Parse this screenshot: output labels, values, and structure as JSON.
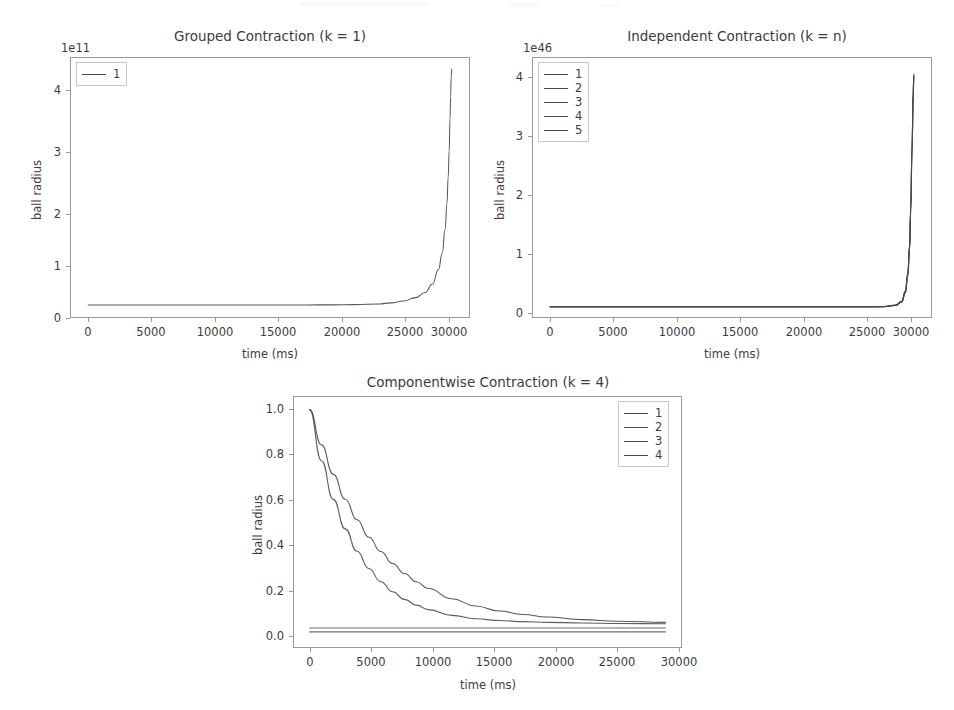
{
  "figure": {
    "background_color": "#ffffff",
    "line_color": "#4a4a4a",
    "axis_color": "#9a9a9a",
    "text_color": "#3c3c3c",
    "n_subplots": 3
  },
  "chart_data": [
    {
      "type": "line",
      "title": "Grouped Contraction (k = 1)",
      "xlabel": "time (ms)",
      "ylabel": "ball radius",
      "y_offset_text": "1e11",
      "xlim": [
        -1500,
        31500
      ],
      "ylim": [
        -0.25,
        4.75
      ],
      "xticks": [
        0,
        5000,
        10000,
        15000,
        20000,
        25000,
        30000
      ],
      "xticklabels": [
        "0",
        "5000",
        "10000",
        "15000",
        "20000",
        "25000",
        "30000"
      ],
      "yticks": [
        0,
        1,
        2,
        3,
        4
      ],
      "yticklabels": [
        "0",
        "1",
        "2",
        "3",
        "4"
      ],
      "grid": false,
      "legend_position": "upper left",
      "legend": [
        "1"
      ],
      "series": [
        {
          "name": "1",
          "x": [
            0,
            2000,
            4000,
            6000,
            8000,
            10000,
            12000,
            14000,
            16000,
            18000,
            20000,
            22000,
            24000,
            25000,
            26000,
            27000,
            27800,
            28400,
            28900,
            29200,
            29450,
            29600,
            29700,
            29780,
            29850,
            29900,
            29950,
            30000
          ],
          "y": [
            0.0,
            0.0,
            0.0,
            0.0,
            0.0,
            0.0,
            0.0,
            0.0,
            0.0,
            0.0,
            0.002,
            0.006,
            0.02,
            0.04,
            0.075,
            0.14,
            0.24,
            0.4,
            0.68,
            0.98,
            1.45,
            1.95,
            2.45,
            2.95,
            3.55,
            4.0,
            4.38,
            4.52
          ]
        }
      ]
    },
    {
      "type": "line",
      "title": "Independent Contraction (k = n)",
      "xlabel": "time (ms)",
      "ylabel": "ball radius",
      "y_offset_text": "1e46",
      "xlim": [
        -1500,
        31500
      ],
      "ylim": [
        -0.2,
        4.45
      ],
      "xticks": [
        0,
        5000,
        10000,
        15000,
        20000,
        25000,
        30000
      ],
      "xticklabels": [
        "0",
        "5000",
        "10000",
        "15000",
        "20000",
        "25000",
        "30000"
      ],
      "yticks": [
        0,
        1,
        2,
        3,
        4
      ],
      "yticklabels": [
        "0",
        "1",
        "2",
        "3",
        "4"
      ],
      "grid": false,
      "legend_position": "upper left",
      "legend": [
        "1",
        "2",
        "3",
        "4",
        "5"
      ],
      "series": [
        {
          "name": "1",
          "x": [
            0,
            5000,
            10000,
            15000,
            20000,
            24000,
            26000,
            27500,
            28500,
            29000,
            29300,
            29500,
            29650,
            29750,
            29850,
            29950,
            30000
          ],
          "y": [
            0.0,
            0.0,
            0.0,
            0.0,
            0.0,
            0.0,
            0.0,
            0.005,
            0.03,
            0.1,
            0.28,
            0.6,
            1.1,
            1.8,
            2.85,
            3.85,
            4.15
          ]
        },
        {
          "name": "2",
          "x": [
            0,
            5000,
            10000,
            15000,
            20000,
            24000,
            26000,
            27500,
            28500,
            29000,
            29300,
            29500,
            29650,
            29750,
            29850,
            29950,
            30000
          ],
          "y": [
            0.0,
            0.0,
            0.0,
            0.0,
            0.0,
            0.0,
            0.0,
            0.004,
            0.028,
            0.095,
            0.27,
            0.58,
            1.08,
            1.78,
            2.82,
            3.82,
            4.13
          ]
        },
        {
          "name": "3",
          "x": [
            0,
            5000,
            10000,
            15000,
            20000,
            24000,
            26000,
            27500,
            28500,
            29000,
            29300,
            29500,
            29650,
            29750,
            29850,
            29950,
            30000
          ],
          "y": [
            0.0,
            0.0,
            0.0,
            0.0,
            0.0,
            0.0,
            0.0,
            0.004,
            0.026,
            0.09,
            0.26,
            0.56,
            1.05,
            1.75,
            2.8,
            3.8,
            4.12
          ]
        },
        {
          "name": "4",
          "x": [
            0,
            5000,
            10000,
            15000,
            20000,
            24000,
            26000,
            27500,
            28500,
            29000,
            29300,
            29500,
            29650,
            29750,
            29850,
            29950,
            30000
          ],
          "y": [
            0.0,
            0.0,
            0.0,
            0.0,
            0.0,
            0.0,
            0.0,
            0.003,
            0.024,
            0.085,
            0.25,
            0.55,
            1.03,
            1.73,
            2.78,
            3.78,
            4.1
          ]
        },
        {
          "name": "5",
          "x": [
            0,
            5000,
            10000,
            15000,
            20000,
            24000,
            26000,
            27500,
            28500,
            29000,
            29300,
            29500,
            29650,
            29750,
            29850,
            29950,
            30000
          ],
          "y": [
            0.0,
            0.0,
            0.0,
            0.0,
            0.0,
            0.0,
            0.0,
            0.003,
            0.022,
            0.08,
            0.24,
            0.54,
            1.01,
            1.71,
            2.76,
            3.76,
            4.08
          ]
        }
      ]
    },
    {
      "type": "line",
      "title": "Componentwise Contraction (k = 4)",
      "xlabel": "time (ms)",
      "ylabel": "ball radius",
      "y_offset_text": "",
      "xlim": [
        -1400,
        31400
      ],
      "ylim": [
        -0.05,
        1.06
      ],
      "xticks": [
        0,
        5000,
        10000,
        15000,
        20000,
        25000,
        30000
      ],
      "xticklabels": [
        "0",
        "5000",
        "10000",
        "15000",
        "20000",
        "25000",
        "30000"
      ],
      "yticks": [
        0.0,
        0.2,
        0.4,
        0.6,
        0.8,
        1.0
      ],
      "yticklabels": [
        "0.0",
        "0.2",
        "0.4",
        "0.6",
        "0.8",
        "1.0"
      ],
      "grid": false,
      "legend_position": "upper right",
      "legend": [
        "1",
        "2",
        "3",
        "4"
      ],
      "series": [
        {
          "name": "1",
          "x": [
            0,
            1000,
            2000,
            3000,
            4000,
            5000,
            6000,
            7000,
            8000,
            9000,
            10000,
            12000,
            14000,
            16000,
            18000,
            20000,
            23000,
            26000,
            30000
          ],
          "y": [
            1.0,
            0.845,
            0.715,
            0.605,
            0.515,
            0.438,
            0.375,
            0.322,
            0.278,
            0.242,
            0.212,
            0.167,
            0.135,
            0.113,
            0.098,
            0.087,
            0.075,
            0.068,
            0.063
          ]
        },
        {
          "name": "2",
          "x": [
            0,
            1000,
            2000,
            3000,
            4000,
            5000,
            6000,
            7000,
            8000,
            9000,
            10000,
            12000,
            14000,
            16000,
            18000,
            20000,
            23000,
            26000,
            30000
          ],
          "y": [
            1.0,
            0.775,
            0.605,
            0.475,
            0.376,
            0.3,
            0.242,
            0.198,
            0.164,
            0.139,
            0.119,
            0.094,
            0.079,
            0.071,
            0.066,
            0.063,
            0.06,
            0.058,
            0.057
          ]
        },
        {
          "name": "3",
          "x": [
            0,
            5000,
            10000,
            15000,
            20000,
            25000,
            30000
          ],
          "y": [
            0.038,
            0.038,
            0.038,
            0.038,
            0.038,
            0.038,
            0.038
          ]
        },
        {
          "name": "4",
          "x": [
            0,
            5000,
            10000,
            15000,
            20000,
            25000,
            30000
          ],
          "y": [
            0.021,
            0.021,
            0.021,
            0.021,
            0.021,
            0.021,
            0.021
          ]
        }
      ]
    }
  ]
}
